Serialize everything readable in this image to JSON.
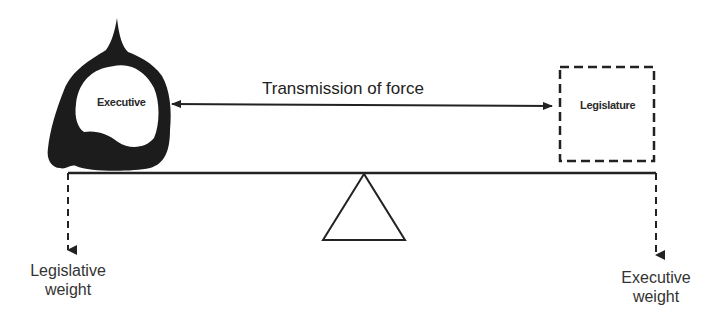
{
  "top_fragment": "by the legislature the ... weig",
  "executive": {
    "label": "Executive",
    "fill_color": "#1a1a1a"
  },
  "legislature": {
    "label": "Legislature",
    "border_style": "dashed"
  },
  "transmission": {
    "label": "Transmission of force",
    "arrow": "double-headed"
  },
  "weights": {
    "left": {
      "line1": "Legislative",
      "line2": "weight"
    },
    "right": {
      "line1": "Executive",
      "line2": "weight"
    }
  },
  "fulcrum": {
    "shape": "triangle"
  },
  "beam": {
    "style": "solid"
  }
}
